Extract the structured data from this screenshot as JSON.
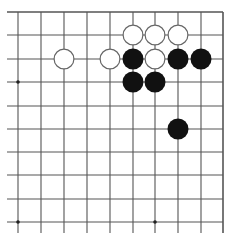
{
  "diagram": {
    "type": "go-board-fragment",
    "colors": {
      "background": "#ffffff",
      "grid_line": "#555555",
      "black_stone": "#111111",
      "white_stone_fill": "#ffffff",
      "white_stone_stroke": "#666666",
      "star_point": "#222222"
    },
    "grid": {
      "cols_x": [
        18,
        41,
        64,
        87,
        110,
        133,
        155,
        178,
        201,
        223
      ],
      "rows_y": [
        12,
        35,
        59,
        82,
        106,
        129,
        152,
        175,
        199,
        222
      ],
      "left_extend_x": 7,
      "bottom_extend_y": 233,
      "edges": {
        "top": true,
        "right": true,
        "left": false,
        "bottom": false
      }
    },
    "stone_radius": 10.5,
    "star_points": [
      {
        "col": 0,
        "row": 3
      },
      {
        "col": 0,
        "row": 9
      },
      {
        "col": 6,
        "row": 9
      }
    ],
    "stones": [
      {
        "color": "white",
        "col": 5,
        "row": 1
      },
      {
        "color": "white",
        "col": 6,
        "row": 1
      },
      {
        "color": "white",
        "col": 7,
        "row": 1
      },
      {
        "color": "white",
        "col": 2,
        "row": 2
      },
      {
        "color": "white",
        "col": 4,
        "row": 2
      },
      {
        "color": "black",
        "col": 5,
        "row": 2
      },
      {
        "color": "white",
        "col": 6,
        "row": 2
      },
      {
        "color": "black",
        "col": 7,
        "row": 2
      },
      {
        "color": "black",
        "col": 8,
        "row": 2
      },
      {
        "color": "black",
        "col": 5,
        "row": 3
      },
      {
        "color": "black",
        "col": 6,
        "row": 3
      },
      {
        "color": "black",
        "col": 7,
        "row": 5
      }
    ]
  }
}
